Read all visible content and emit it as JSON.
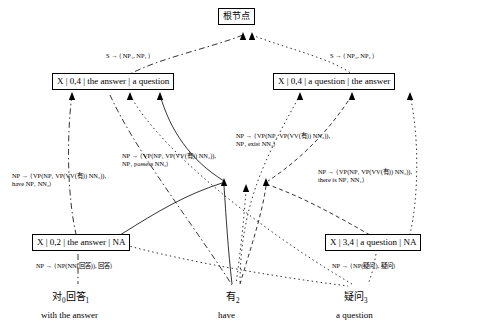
{
  "diagram": {
    "nodes": [
      {
        "id": "root",
        "text": "根节点"
      },
      {
        "id": "left_span04",
        "text": "X | 0,4 | the answer | a question"
      },
      {
        "id": "right_span04",
        "text": "X | 0,4 | a question | the answer"
      },
      {
        "id": "span02",
        "text": "X | 0,2 | the answer | NA"
      },
      {
        "id": "span34",
        "text": "X | 3,4 | a question | NA"
      }
    ],
    "rule_labels": [
      {
        "id": "s_rule_left",
        "text": "S → ⟨ NP₁, NP₁ ⟩"
      },
      {
        "id": "s_rule_right",
        "text": "S → ⟨ NP₂, NP₂ ⟩"
      },
      {
        "id": "np_rule_have_left",
        "line1": "NP → ⟨ VP(NP₁ VP(VV(有)) NN₂)),",
        "line2": "have NP₁ NN₂⟩"
      },
      {
        "id": "np_rule_possess",
        "line1": "NP → ⟨ VP(NP₁ VP(VV(有)) NN₂)),",
        "line2": "NP₁ possess NN₂⟩"
      },
      {
        "id": "np_rule_exist",
        "line1": "NP → ⟨ VP(NP₁ VP(VV(有)) NN₂)),",
        "line2": "NP₁ exist NN₂⟩"
      },
      {
        "id": "np_rule_there_is",
        "line1": "NP → ⟨ VP(NP₁ VP(VV(有)) NN₂)),",
        "line2": "there is NP₁ NN₂⟩"
      },
      {
        "id": "np_rule_answer",
        "text": "NP → ⟨ NP(NN(回答)), 回答⟩"
      },
      {
        "id": "np_rule_question",
        "text": "NP → ⟨ NP(疑问), 疑问⟩"
      }
    ],
    "words": [
      {
        "id": "w1",
        "text": "对",
        "sub": "0",
        "rest": "回答",
        "rest_sub": "1",
        "gloss": "with the answer"
      },
      {
        "id": "w2",
        "text": "有",
        "sub": "2",
        "rest": "",
        "rest_sub": "",
        "gloss": "have"
      },
      {
        "id": "w3",
        "text": "疑问",
        "sub": "3",
        "rest": "",
        "rest_sub": "",
        "gloss": "a question"
      }
    ]
  }
}
